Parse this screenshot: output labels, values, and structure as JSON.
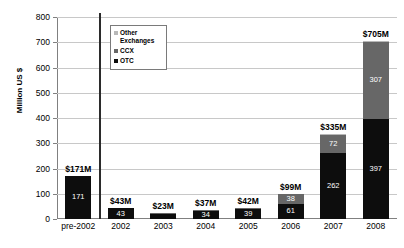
{
  "chart_data": {
    "type": "bar",
    "title": "",
    "subtitle": "",
    "xlabel": "",
    "ylabel": "Million US $",
    "ylim": [
      0,
      800
    ],
    "ytick_step": 100,
    "yticks": [
      0,
      100,
      200,
      300,
      400,
      500,
      600,
      700,
      800
    ],
    "grid": true,
    "stacked": true,
    "legend_position": "inside-top-left",
    "categories": [
      "pre-2002",
      "2002",
      "2003",
      "2004",
      "2005",
      "2006",
      "2007",
      "2008"
    ],
    "series": [
      {
        "name": "OTC",
        "color": "#0d0d0d",
        "values": [
          171,
          43,
          22,
          34,
          39,
          61,
          262,
          397
        ]
      },
      {
        "name": "CCX",
        "color": "#676767",
        "values": [
          0,
          0,
          1,
          3,
          3,
          38,
          72,
          307
        ]
      },
      {
        "name": "Other Exchanges",
        "color": "#b8b8b8",
        "values": [
          0,
          0,
          0,
          0,
          0,
          0,
          1,
          1
        ]
      }
    ],
    "totals": [
      171,
      43,
      23,
      37,
      42,
      99,
      335,
      705
    ],
    "total_labels": [
      "$171M",
      "$43M",
      "$23M",
      "$37M",
      "$42M",
      "$99M",
      "$335M",
      "$705M"
    ],
    "annotations": [
      "Vertical separator drawn after the pre-2002 category"
    ]
  },
  "legend": {
    "items": [
      {
        "label": "Other Exchanges",
        "color": "#b8b8b8"
      },
      {
        "label": "CCX",
        "color": "#676767"
      },
      {
        "label": "OTC",
        "color": "#0d0d0d"
      }
    ]
  },
  "axes": {
    "y_title": "Million US $",
    "y_labels": [
      "800",
      "700",
      "600",
      "500",
      "400",
      "300",
      "200",
      "100",
      "0"
    ],
    "x_labels": [
      "pre-2002",
      "2002",
      "2003",
      "2004",
      "2005",
      "2006",
      "2007",
      "2008"
    ]
  }
}
